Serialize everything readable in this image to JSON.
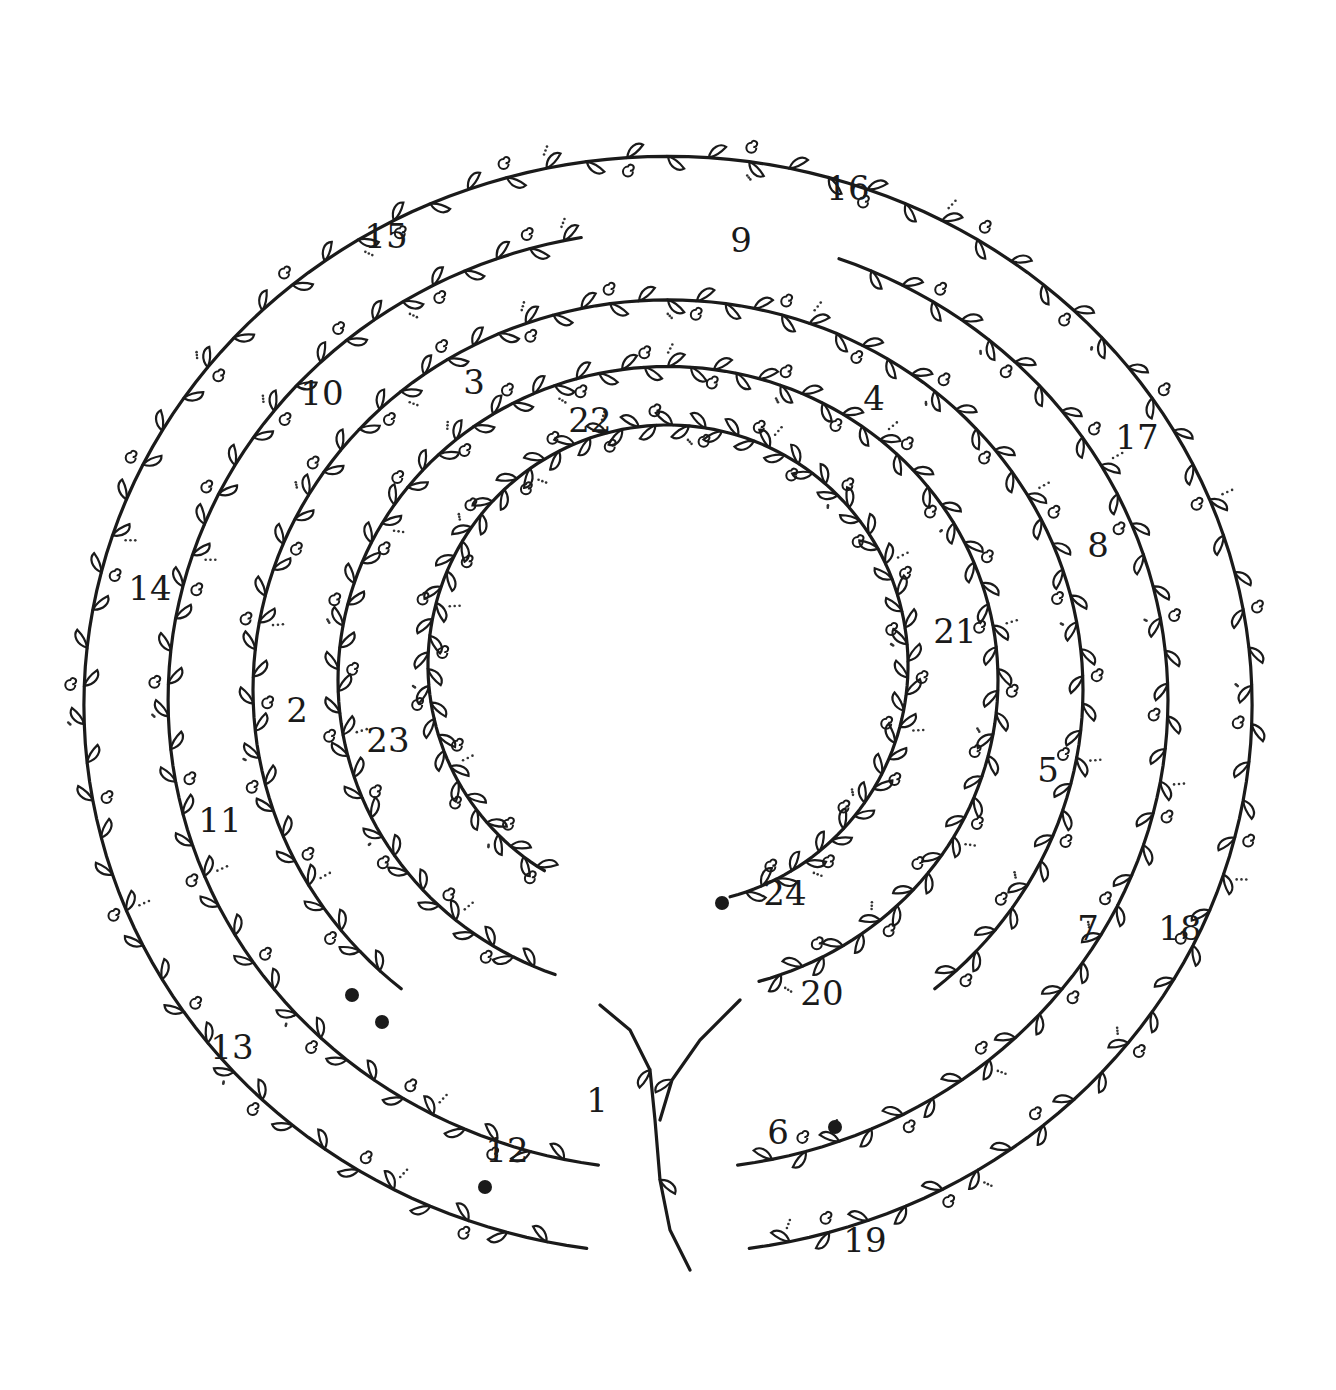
{
  "diagram": {
    "type": "labyrinth-dot-to-dot",
    "style": "hand-drawn vine with leaves and curls",
    "colors": {
      "ink": "#1a1a1a",
      "paper": "#ffffff"
    },
    "center": [
      668,
      695
    ],
    "rings": [
      {
        "name": "ring-outer",
        "radius": 590
      },
      {
        "name": "ring-2",
        "radius": 500
      },
      {
        "name": "ring-3",
        "radius": 410
      },
      {
        "name": "ring-4",
        "radius": 320
      },
      {
        "name": "ring-inner",
        "radius": 240
      }
    ],
    "numbers": [
      {
        "label": "1",
        "x": 597,
        "y": 1100
      },
      {
        "label": "2",
        "x": 297,
        "y": 710
      },
      {
        "label": "3",
        "x": 474,
        "y": 382
      },
      {
        "label": "4",
        "x": 874,
        "y": 398
      },
      {
        "label": "5",
        "x": 1048,
        "y": 770
      },
      {
        "label": "6",
        "x": 778,
        "y": 1132
      },
      {
        "label": "7",
        "x": 1088,
        "y": 928
      },
      {
        "label": "8",
        "x": 1098,
        "y": 545
      },
      {
        "label": "9",
        "x": 741,
        "y": 240
      },
      {
        "label": "10",
        "x": 322,
        "y": 393
      },
      {
        "label": "11",
        "x": 220,
        "y": 820
      },
      {
        "label": "12",
        "x": 507,
        "y": 1150
      },
      {
        "label": "13",
        "x": 232,
        "y": 1047
      },
      {
        "label": "14",
        "x": 150,
        "y": 588
      },
      {
        "label": "15",
        "x": 386,
        "y": 236
      },
      {
        "label": "16",
        "x": 848,
        "y": 188
      },
      {
        "label": "17",
        "x": 1137,
        "y": 437
      },
      {
        "label": "18",
        "x": 1180,
        "y": 928
      },
      {
        "label": "19",
        "x": 865,
        "y": 1240
      },
      {
        "label": "20",
        "x": 822,
        "y": 993
      },
      {
        "label": "21",
        "x": 955,
        "y": 631
      },
      {
        "label": "22",
        "x": 590,
        "y": 420
      },
      {
        "label": "23",
        "x": 388,
        "y": 740
      },
      {
        "label": "24",
        "x": 785,
        "y": 893
      }
    ],
    "end_dots": [
      {
        "name": "dot-12",
        "x": 485,
        "y": 1187
      },
      {
        "name": "dot-6",
        "x": 835,
        "y": 1127
      },
      {
        "name": "dot-24",
        "x": 722,
        "y": 903
      },
      {
        "name": "dot-left",
        "x": 352,
        "y": 995
      },
      {
        "name": "dot-left-2",
        "x": 382,
        "y": 1022
      }
    ]
  }
}
